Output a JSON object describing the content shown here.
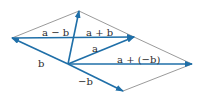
{
  "diagram": {
    "colors": {
      "vector": "#1f6fa8",
      "guide": "#555555",
      "label": "#2b2b2b",
      "background": "#ffffff"
    },
    "labels": {
      "a_minus_b": "a − b",
      "a_plus_b": "a + b",
      "a": "a",
      "b": "b",
      "a_plus_neg_b": "a + (−b)",
      "neg_b": "−b"
    },
    "points": {
      "origin": [
        68,
        64
      ],
      "a_tip": [
        134,
        37
      ],
      "b_tip": [
        12,
        38
      ],
      "a_plus_b_tip": [
        79,
        11
      ],
      "neg_b_tip": [
        123,
        91
      ],
      "a_plus_neg_b_tip": [
        192,
        64
      ]
    }
  }
}
